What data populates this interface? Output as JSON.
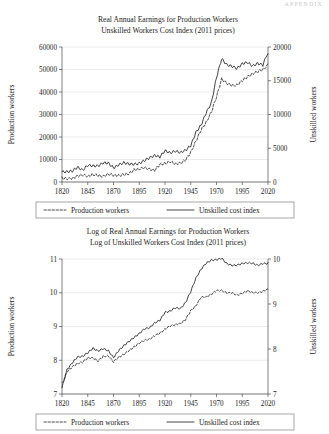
{
  "page": {
    "running_head": "APPENDIX"
  },
  "figures": [
    {
      "id": "top",
      "title_line1": "Real Annual Earnings for Production Workers",
      "title_line2": "Unskilled Workers Cost Index (2011 prices)",
      "left_axis_label": "Production workers",
      "right_axis_label": "Unskilled workers",
      "legend": {
        "dashed_label": "Production workers",
        "solid_label": "Unskilled cost index"
      }
    },
    {
      "id": "bottom",
      "title_line1": "Log of Real Annual Earnings for Production Workers",
      "title_line2": "Log of Unskilled Workers Cost Index (2011 prices)",
      "left_axis_label": "Production workers",
      "right_axis_label": "Unskilled workers",
      "legend": {
        "dashed_label": "Production workers",
        "solid_label": "Unskilled cost index"
      }
    }
  ],
  "chart_data": [
    {
      "type": "line",
      "id": "levels",
      "title": "Real Annual Earnings for Production Workers / Unskilled Workers Cost Index (2011 prices)",
      "xlabel": "",
      "ylabel": "Production workers",
      "y2label": "Unskilled workers",
      "grid": true,
      "legend_position": "below",
      "xlim": [
        1820,
        2020
      ],
      "xticks": [
        1820,
        1845,
        1870,
        1895,
        1920,
        1945,
        1970,
        1995,
        2020
      ],
      "ylim": [
        0,
        60000
      ],
      "yticks": [
        0,
        10000,
        20000,
        30000,
        40000,
        50000,
        60000
      ],
      "y2lim": [
        0,
        20000
      ],
      "y2ticks": [
        0,
        5000,
        10000,
        15000,
        20000
      ],
      "x": [
        1820,
        1825,
        1830,
        1835,
        1840,
        1845,
        1850,
        1855,
        1860,
        1865,
        1870,
        1875,
        1880,
        1885,
        1890,
        1895,
        1900,
        1905,
        1910,
        1915,
        1920,
        1925,
        1930,
        1935,
        1940,
        1945,
        1950,
        1955,
        1960,
        1965,
        1970,
        1975,
        1980,
        1985,
        1990,
        1995,
        2000,
        2005,
        2010,
        2015,
        2020
      ],
      "series": [
        {
          "name": "Unskilled cost index",
          "axis": "right",
          "style": "solid",
          "values": [
            1650,
            1750,
            1900,
            2100,
            2050,
            2250,
            2350,
            2300,
            2500,
            2450,
            2300,
            2450,
            2600,
            2750,
            2950,
            3050,
            3250,
            3400,
            3600,
            3900,
            4500,
            4300,
            4450,
            4200,
            4700,
            5650,
            7200,
            8700,
            10150,
            12000,
            15600,
            18600,
            17500,
            16900,
            17000,
            17800,
            18000,
            17200,
            17400,
            17300,
            19000
          ]
        },
        {
          "name": "Production workers",
          "axis": "left",
          "style": "dashed",
          "values": [
            1500,
            1700,
            2000,
            2300,
            2500,
            2800,
            3000,
            3100,
            3300,
            3400,
            3300,
            3600,
            3900,
            4200,
            4600,
            4900,
            5400,
            5800,
            6300,
            6900,
            8000,
            8300,
            9000,
            8700,
            10500,
            13500,
            18500,
            22500,
            26000,
            30500,
            38500,
            45500,
            44500,
            43200,
            43500,
            45500,
            47500,
            48000,
            49000,
            50500,
            52500
          ]
        }
      ]
    },
    {
      "type": "line",
      "id": "logs",
      "title": "Log of Real Annual Earnings for Production Workers / Log of Unskilled Workers Cost Index (2011 prices)",
      "xlabel": "",
      "ylabel": "Production workers",
      "y2label": "Unskilled workers",
      "grid": true,
      "legend_position": "below",
      "xlim": [
        1820,
        2020
      ],
      "xticks": [
        1820,
        1845,
        1870,
        1895,
        1920,
        1945,
        1970,
        1995,
        2020
      ],
      "ylim": [
        7,
        11
      ],
      "yticks": [
        7,
        8,
        9,
        10,
        11
      ],
      "y2lim": [
        7,
        10
      ],
      "y2ticks": [
        7,
        8,
        9,
        10
      ],
      "x": [
        1820,
        1825,
        1830,
        1835,
        1840,
        1845,
        1850,
        1855,
        1860,
        1865,
        1870,
        1875,
        1880,
        1885,
        1890,
        1895,
        1900,
        1905,
        1910,
        1915,
        1920,
        1925,
        1930,
        1935,
        1940,
        1945,
        1950,
        1955,
        1960,
        1965,
        1970,
        1975,
        1980,
        1985,
        1990,
        1995,
        2000,
        2005,
        2010,
        2015,
        2020
      ],
      "series": [
        {
          "name": "Unskilled cost index",
          "axis": "right",
          "style": "solid",
          "values": [
            7.15,
            7.55,
            7.72,
            7.85,
            7.82,
            7.95,
            7.98,
            7.92,
            8.02,
            7.98,
            7.82,
            7.95,
            8.05,
            8.15,
            8.28,
            8.33,
            8.42,
            8.48,
            8.55,
            8.65,
            8.78,
            8.82,
            8.92,
            8.88,
            9.02,
            9.28,
            9.55,
            9.75,
            9.88,
            9.95,
            9.96,
            9.98,
            9.9,
            9.88,
            9.87,
            9.9,
            9.9,
            9.88,
            9.88,
            9.87,
            9.92
          ]
        },
        {
          "name": "Production workers",
          "axis": "left",
          "style": "dashed",
          "values": [
            7.3,
            7.65,
            7.82,
            7.95,
            7.92,
            8.05,
            8.08,
            8.02,
            8.12,
            8.08,
            7.92,
            8.08,
            8.18,
            8.28,
            8.4,
            8.48,
            8.58,
            8.66,
            8.72,
            8.82,
            8.95,
            8.98,
            9.08,
            9.04,
            9.18,
            9.42,
            9.65,
            9.82,
            9.92,
            10.0,
            10.02,
            10.05,
            9.98,
            9.96,
            9.96,
            10.0,
            10.02,
            10.03,
            10.05,
            10.06,
            10.1
          ]
        }
      ]
    }
  ]
}
